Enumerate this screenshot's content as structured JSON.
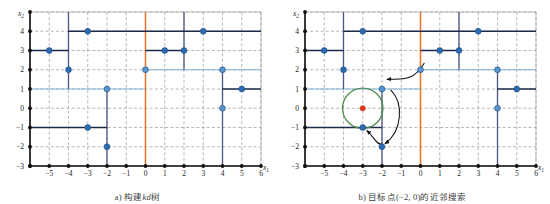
{
  "figure": {
    "colors": {
      "grid": "#9a9a9a",
      "axis": "#111111",
      "split_dark": "#1b2a4a",
      "split_navy": "#4a5580",
      "split_light_blue": "#7fb3d8",
      "split_orange": "#e8712a",
      "point_blue": "#2d6bb5",
      "point_blue_light": "#5a95cf",
      "target_red": "#e8361c",
      "circle_green": "#4e8b4e",
      "arrow": "#111111",
      "frame": "#b5b5b5",
      "caption": "#3b3b3b"
    },
    "axes": {
      "xlabel": "x",
      "xlabel_sub": "1",
      "ylabel": "x",
      "ylabel_sub": "2",
      "xticks": [
        "-5",
        "-4",
        "-3",
        "-2",
        "-1",
        "0",
        "1",
        "2",
        "3",
        "4",
        "5",
        "6"
      ],
      "xtick_values": [
        -5,
        -4,
        -3,
        -2,
        -1,
        0,
        1,
        2,
        3,
        4,
        5,
        6
      ],
      "yticks": [
        "4",
        "3",
        "2",
        "1",
        "0",
        "-1",
        "-2",
        "-3"
      ],
      "ytick_values": [
        4,
        3,
        2,
        1,
        0,
        -1,
        -2,
        -3
      ],
      "xlim": [
        -6,
        6
      ],
      "ylim": [
        -3,
        5
      ],
      "grid": "dashed"
    },
    "panels": [
      {
        "id": "a",
        "caption_pre": "a) 构建",
        "caption_em": "kd",
        "caption_post": "树",
        "caption_full": "a) 构建kd树"
      },
      {
        "id": "b",
        "caption_pre": "b) 目标点(−2, 0)的近邻搜索",
        "caption_em": "",
        "caption_post": "",
        "caption_full": "b) 目标点(−2, 0)的近邻搜索"
      }
    ],
    "points": [
      {
        "name": "p-m5-3",
        "x": -5,
        "y": 3,
        "style": "dark"
      },
      {
        "name": "p-m4-2",
        "x": -4,
        "y": 2,
        "style": "dark"
      },
      {
        "name": "p-m3-4",
        "x": -3,
        "y": 4,
        "style": "dark"
      },
      {
        "name": "p-m3-m1",
        "x": -3,
        "y": -1,
        "style": "dark"
      },
      {
        "name": "p-m2-1",
        "x": -2,
        "y": 1,
        "style": "light"
      },
      {
        "name": "p-m2-m2",
        "x": -2,
        "y": -2,
        "style": "dark"
      },
      {
        "name": "p-0-2",
        "x": 0,
        "y": 2,
        "style": "light"
      },
      {
        "name": "p-1-3",
        "x": 1,
        "y": 3,
        "style": "dark"
      },
      {
        "name": "p-2-3",
        "x": 2,
        "y": 3,
        "style": "dark"
      },
      {
        "name": "p-3-4",
        "x": 3,
        "y": 4,
        "style": "dark"
      },
      {
        "name": "p-4-2",
        "x": 4,
        "y": 2,
        "style": "light"
      },
      {
        "name": "p-4-0",
        "x": 4,
        "y": 0,
        "style": "light"
      },
      {
        "name": "p-5-1",
        "x": 5,
        "y": 1,
        "style": "dark"
      }
    ],
    "split_lines": [
      {
        "name": "split-root-x0",
        "orient": "v",
        "at": 0,
        "from": -3,
        "to": 5,
        "color": "split_orange",
        "w": 1.5
      },
      {
        "name": "split-y1-left",
        "orient": "h",
        "at": 1,
        "from": -6,
        "to": 0,
        "color": "split_light_blue",
        "w": 1.2
      },
      {
        "name": "split-y2-right",
        "orient": "h",
        "at": 2,
        "from": 0,
        "to": 6,
        "color": "split_light_blue",
        "w": 1.2
      },
      {
        "name": "split-x-m4-up",
        "orient": "v",
        "at": -4,
        "from": 1,
        "to": 5,
        "color": "split_navy",
        "w": 1.3
      },
      {
        "name": "split-x-m2-up",
        "orient": "v",
        "at": -2,
        "from": -3,
        "to": 1,
        "color": "split_navy",
        "w": 1.3
      },
      {
        "name": "split-x-2-up",
        "orient": "v",
        "at": 2,
        "from": 2,
        "to": 5,
        "color": "split_navy",
        "w": 1.3
      },
      {
        "name": "split-x-4-low",
        "orient": "v",
        "at": 4,
        "from": -3,
        "to": 2,
        "color": "split_navy",
        "w": 1.3
      },
      {
        "name": "split-y3-left",
        "orient": "h",
        "at": 3,
        "from": -6,
        "to": -4,
        "color": "split_dark",
        "w": 1.3
      },
      {
        "name": "split-y4-mid",
        "orient": "h",
        "at": 4,
        "from": -4,
        "to": 2,
        "color": "split_dark",
        "w": 1.3
      },
      {
        "name": "split-y4-right",
        "orient": "h",
        "at": 4,
        "from": 2,
        "to": 6,
        "color": "split_dark",
        "w": 1.3
      },
      {
        "name": "split-y3-mid",
        "orient": "h",
        "at": 3,
        "from": 0,
        "to": 2,
        "color": "split_dark",
        "w": 1.3
      },
      {
        "name": "split-ym1-left",
        "orient": "h",
        "at": -1,
        "from": -6,
        "to": -2,
        "color": "split_dark",
        "w": 1.3
      },
      {
        "name": "split-y1-right",
        "orient": "h",
        "at": 1,
        "from": 4,
        "to": 6,
        "color": "split_dark",
        "w": 1.3
      }
    ],
    "search": {
      "target": {
        "name": "target-point",
        "x": -3,
        "y": 0,
        "label": "(−2, 0)"
      },
      "circle": {
        "name": "search-circle",
        "cx": -3,
        "cy": 0,
        "r": 1.05
      },
      "arrows": [
        {
          "name": "arrow-to-leaf-upper",
          "desc": "from (0,2) split curving left to point (-2,1)"
        },
        {
          "name": "arrow-to-leaf-lower",
          "desc": "from (-2,1) curving down to point (-2,-2)"
        },
        {
          "name": "arrow-to-nearest",
          "desc": "from (-2,-2) pointing to point (-3,-1)"
        }
      ]
    }
  }
}
